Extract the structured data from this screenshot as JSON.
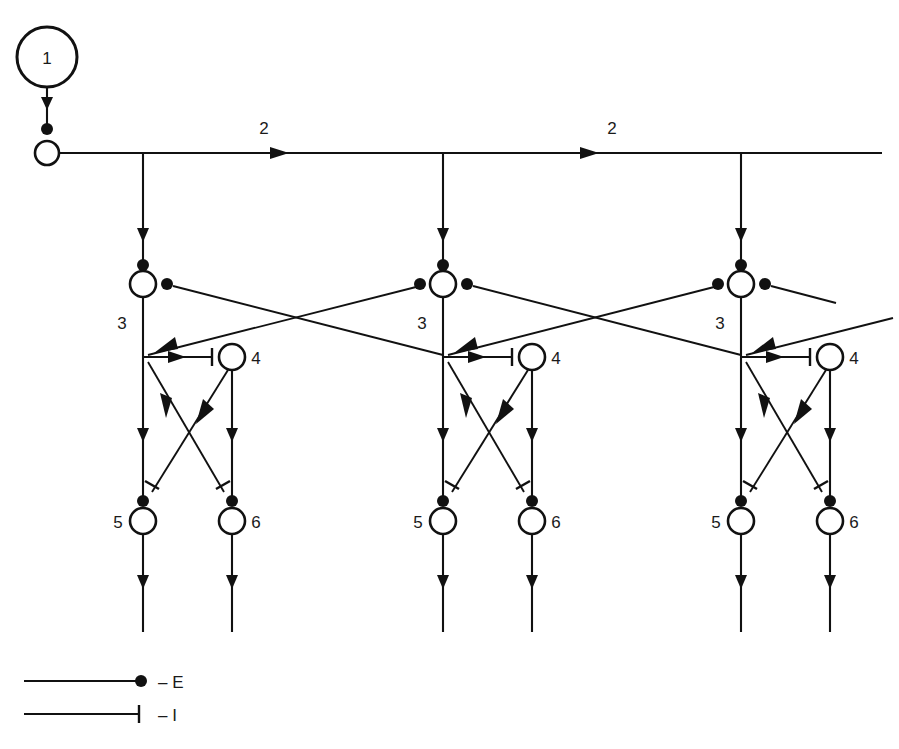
{
  "figure": {
    "title": "",
    "background_color": "#ffffff",
    "line_color": "#111111",
    "width": 899,
    "height": 749
  },
  "nodes": {
    "source": {
      "label": "1",
      "cx": 47,
      "cy": 57,
      "r": 30,
      "type": "source-oscillator"
    },
    "bus_node": {
      "label": "",
      "cx": 47,
      "cy": 153,
      "r": 12,
      "type": "bus-origin"
    },
    "modules": [
      {
        "id": "module-left",
        "x_center": 143,
        "node3": {
          "label": "3",
          "cx": 143,
          "cy": 284,
          "r": 13
        },
        "node4": {
          "label": "4",
          "cx": 232,
          "cy": 357,
          "r": 13
        },
        "node5": {
          "label": "5",
          "cx": 143,
          "cy": 521,
          "r": 13
        },
        "node6": {
          "label": "6",
          "cx": 232,
          "cy": 521,
          "r": 13
        }
      },
      {
        "id": "module-center",
        "x_center": 443,
        "node3": {
          "label": "3",
          "cx": 443,
          "cy": 284,
          "r": 13
        },
        "node4": {
          "label": "4",
          "cx": 532,
          "cy": 357,
          "r": 13
        },
        "node5": {
          "label": "5",
          "cx": 443,
          "cy": 521,
          "r": 13
        },
        "node6": {
          "label": "6",
          "cx": 532,
          "cy": 521,
          "r": 13
        }
      },
      {
        "id": "module-right",
        "x_center": 741,
        "node3": {
          "label": "3",
          "cx": 741,
          "cy": 284,
          "r": 13
        },
        "node4": {
          "label": "4",
          "cx": 830,
          "cy": 357,
          "r": 13
        },
        "node5": {
          "label": "5",
          "cx": 741,
          "cy": 521,
          "r": 13
        },
        "node6": {
          "label": "6",
          "cx": 830,
          "cy": 521,
          "r": 13
        }
      }
    ]
  },
  "bus": {
    "y": 153,
    "x_start": 59,
    "x_end": 882,
    "labels": [
      {
        "text": "2",
        "x": 264,
        "y": 134
      },
      {
        "text": "2",
        "x": 612,
        "y": 134
      }
    ],
    "arrow_x_positions": [
      282,
      592
    ]
  },
  "legend": {
    "items": [
      {
        "symbol": "excitatory-dot",
        "label": "– E",
        "y": 681,
        "x_start": 24,
        "x_end": 143
      },
      {
        "symbol": "inhibitory-bar",
        "label": "– I",
        "y": 714,
        "x_start": 24,
        "x_end": 141
      }
    ]
  },
  "annotations": {
    "node_labels": [
      "1",
      "2",
      "3",
      "4",
      "5",
      "6"
    ],
    "connection_types": {
      "E": "excitatory",
      "I": "inhibitory"
    }
  }
}
